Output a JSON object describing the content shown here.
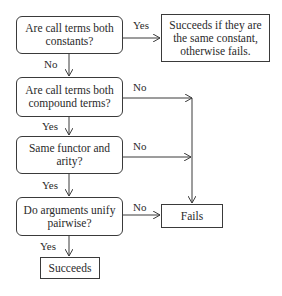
{
  "diagram": {
    "type": "flowchart",
    "decisions": [
      {
        "id": "d1",
        "text": "Are call terms both constants?"
      },
      {
        "id": "d2",
        "text": "Are call terms both compound terms?"
      },
      {
        "id": "d3",
        "text": "Same functor and arity?"
      },
      {
        "id": "d4",
        "text": "Do arguments unify pairwise?"
      }
    ],
    "outcomes": {
      "constants": "Succeeds if they are the same constant, otherwise fails.",
      "fails": "Fails",
      "succeeds": "Succeeds"
    },
    "edge_labels": {
      "d1_yes": "Yes",
      "d1_no": "No",
      "d2_yes": "Yes",
      "d2_no": "No",
      "d3_yes": "Yes",
      "d3_no": "No",
      "d4_yes": "Yes",
      "d4_no": "No"
    },
    "line_color": "#3a3a3a"
  }
}
